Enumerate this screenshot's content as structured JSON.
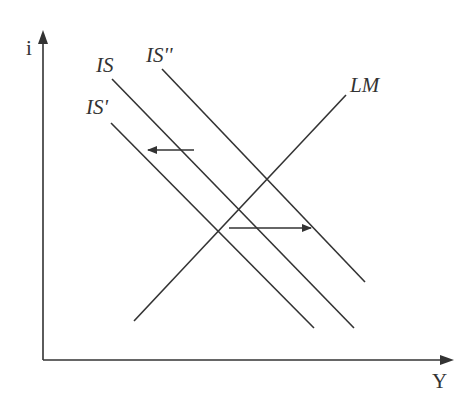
{
  "diagram": {
    "type": "IS-LM model",
    "axes": {
      "x_label": "Y",
      "y_label": "i"
    },
    "curves": [
      {
        "id": "IS",
        "label": "IS",
        "kind": "downward-sloping"
      },
      {
        "id": "IS_prime",
        "label": "IS'",
        "kind": "downward-sloping"
      },
      {
        "id": "IS_double_prime",
        "label": "IS''",
        "kind": "downward-sloping"
      },
      {
        "id": "LM",
        "label": "LM",
        "kind": "upward-sloping"
      }
    ],
    "arrows": [
      {
        "id": "shift-left",
        "direction": "left",
        "meaning": "IS shifts to IS'"
      },
      {
        "id": "shift-right",
        "direction": "right",
        "meaning": "IS shifts to IS''"
      }
    ],
    "colors": {
      "line": "#333333",
      "background": "#ffffff"
    }
  }
}
